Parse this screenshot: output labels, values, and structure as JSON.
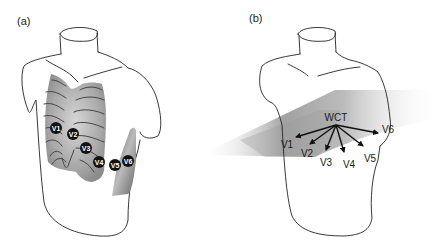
{
  "figure": {
    "panel_a": {
      "label": "(a)",
      "electrodes": [
        {
          "id": "V1",
          "label": "V1"
        },
        {
          "id": "V2",
          "label": "V2"
        },
        {
          "id": "V3",
          "label": "V3"
        },
        {
          "id": "V4",
          "label": "V4"
        },
        {
          "id": "V5",
          "label": "V5"
        },
        {
          "id": "V6",
          "label": "V6"
        }
      ]
    },
    "panel_b": {
      "label": "(b)",
      "center_label": "WCT",
      "leads": [
        {
          "id": "V1",
          "label": "V1"
        },
        {
          "id": "V2",
          "label": "V2"
        },
        {
          "id": "V3",
          "label": "V3"
        },
        {
          "id": "V4",
          "label": "V4"
        },
        {
          "id": "V5",
          "label": "V5"
        },
        {
          "id": "V6",
          "label": "V6"
        }
      ]
    },
    "colors": {
      "outline": "#222222",
      "electrode_fill": "#111111",
      "ribcage_shade": "#9a9a9a",
      "plane_shade": "#8a8a8a"
    }
  }
}
